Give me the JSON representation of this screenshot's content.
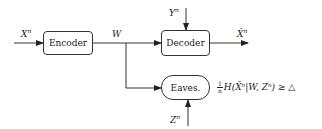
{
  "diagram": {
    "blocks": {
      "encoder": "Encoder",
      "decoder": "Decoder",
      "eavesdropper": "Eaves."
    },
    "signals": {
      "source_input": "X",
      "source_input_sup": "n",
      "message": "W",
      "side_info_decoder": "Y",
      "side_info_decoder_sup": "n",
      "reconstruction": "X̂",
      "reconstruction_sup": "n",
      "side_info_eaves": "Z",
      "side_info_eaves_sup": "n"
    },
    "constraint": {
      "frac_num": "1",
      "frac_den": "n",
      "expression": "H(X̂ⁿ|W, Zⁿ) ≥ △"
    },
    "colors": {
      "stroke": "#333333",
      "background": "#ffffff"
    }
  }
}
